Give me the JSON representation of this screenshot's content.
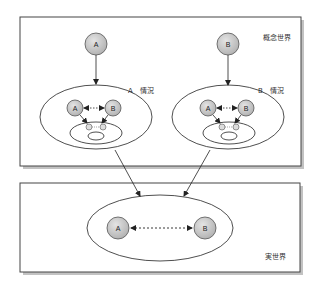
{
  "diagram": {
    "concept_world": {
      "label": "概念世界",
      "top_nodes": [
        {
          "id": "A",
          "label": "A"
        },
        {
          "id": "B",
          "label": "B"
        }
      ],
      "situations": [
        {
          "label": "A　情況",
          "nodes": [
            {
              "label": "A"
            },
            {
              "label": "B"
            }
          ]
        },
        {
          "label": "B　情況",
          "nodes": [
            {
              "label": "A"
            },
            {
              "label": "B"
            }
          ]
        }
      ]
    },
    "real_world": {
      "label": "実世界",
      "nodes": [
        {
          "label": "A"
        },
        {
          "label": "B"
        }
      ]
    },
    "colors": {
      "node_fill": "#c8c8c8",
      "node_stroke": "#555555",
      "line": "#222222",
      "box_border": "#444444",
      "box_shadow": "#888888"
    }
  }
}
